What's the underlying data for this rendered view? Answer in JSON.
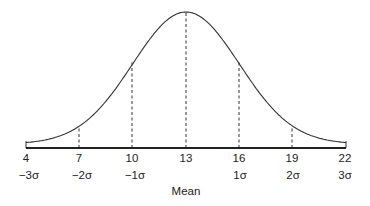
{
  "chart_data": {
    "type": "line",
    "mean": 13,
    "sd": 3,
    "x_ticks": [
      4,
      7,
      10,
      13,
      16,
      19,
      22
    ],
    "sigma_labels": [
      "−3σ",
      "−2σ",
      "−1σ",
      "",
      "1σ",
      "2σ",
      "3σ"
    ],
    "xlabel": "Mean",
    "xlim": [
      4,
      22
    ],
    "dashed_lines_at": [
      7,
      10,
      13,
      16,
      19
    ],
    "grid": false
  },
  "labels": {
    "ticks": [
      "4",
      "7",
      "10",
      "13",
      "16",
      "19",
      "22"
    ],
    "sigmas": [
      "−3σ",
      "−2σ",
      "−1σ",
      "1σ",
      "2σ",
      "3σ"
    ],
    "mean": "Mean"
  }
}
